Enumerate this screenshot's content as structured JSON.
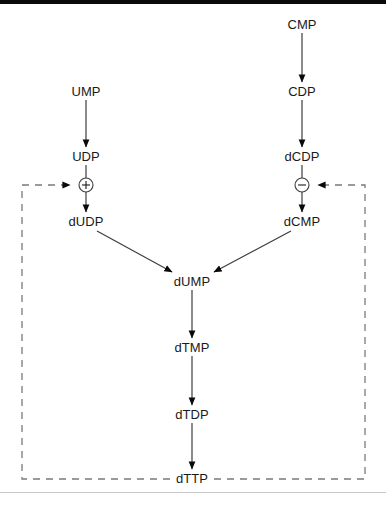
{
  "diagram": {
    "type": "biochemical-pathway-flowchart",
    "colors": {
      "line": "#3d3d3d",
      "arrowhead": "#0a0a0a",
      "dashed": "#7a7a7a",
      "text": "#1a1a1a",
      "top_bar": "#0a0a0a",
      "background": "#ffffff"
    },
    "nodes": [
      {
        "id": "ump",
        "label": "UMP",
        "x": 86,
        "y": 92
      },
      {
        "id": "udp",
        "label": "UDP",
        "x": 86,
        "y": 157
      },
      {
        "id": "dudp",
        "label": "dUDP",
        "x": 86,
        "y": 222
      },
      {
        "id": "cmp",
        "label": "CMP",
        "x": 302,
        "y": 25
      },
      {
        "id": "cdp",
        "label": "CDP",
        "x": 302,
        "y": 92
      },
      {
        "id": "dcdp",
        "label": "dCDP",
        "x": 302,
        "y": 157
      },
      {
        "id": "dcmp",
        "label": "dCMP",
        "x": 302,
        "y": 222
      },
      {
        "id": "dump",
        "label": "dUMP",
        "x": 192,
        "y": 282
      },
      {
        "id": "dtmp",
        "label": "dTMP",
        "x": 192,
        "y": 348
      },
      {
        "id": "dtdp",
        "label": "dTDP",
        "x": 192,
        "y": 415
      },
      {
        "id": "dttp",
        "label": "dTTP",
        "x": 192,
        "y": 479
      }
    ],
    "regulators": [
      {
        "id": "activation",
        "symbol": "+",
        "sign": "plus",
        "x": 86,
        "y": 185,
        "target": "udp-to-dudp"
      },
      {
        "id": "inhibition",
        "symbol": "−",
        "sign": "minus",
        "x": 302,
        "y": 185,
        "target": "dcdp-to-dcmp"
      }
    ],
    "arrows": [
      {
        "from": "ump",
        "to": "udp",
        "style": "solid"
      },
      {
        "from": "udp",
        "to": "dudp",
        "style": "solid"
      },
      {
        "from": "cmp",
        "to": "cdp",
        "style": "solid"
      },
      {
        "from": "cdp",
        "to": "dcdp",
        "style": "solid"
      },
      {
        "from": "dcdp",
        "to": "dcmp",
        "style": "solid"
      },
      {
        "from": "dudp",
        "to": "dump",
        "style": "solid"
      },
      {
        "from": "dcmp",
        "to": "dump",
        "style": "solid"
      },
      {
        "from": "dump",
        "to": "dtmp",
        "style": "solid"
      },
      {
        "from": "dtmp",
        "to": "dtdp",
        "style": "solid"
      },
      {
        "from": "dtdp",
        "to": "dttp",
        "style": "solid"
      }
    ],
    "feedback_loops": [
      {
        "id": "dttp-activates-dudp",
        "from": "dttp",
        "to": "activation",
        "style": "dashed",
        "side": "left"
      },
      {
        "id": "dttp-inhibits-dcdp",
        "from": "dttp",
        "to": "inhibition",
        "style": "dashed",
        "side": "right"
      }
    ]
  }
}
